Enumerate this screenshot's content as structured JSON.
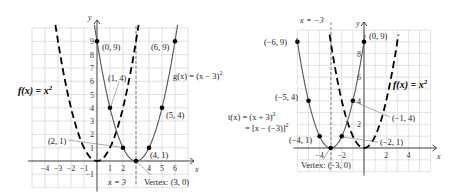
{
  "chart_data": [
    {
      "type": "line",
      "title": "Horizontal shift right: g(x) = (x - 3)^2",
      "xlabel": "x",
      "ylabel": "y",
      "xlim": [
        -5,
        7
      ],
      "ylim": [
        -2,
        10
      ],
      "grid": true,
      "x_ticks": [
        "-4",
        "-3",
        "-2",
        "-1",
        "1",
        "2",
        "4",
        "5",
        "6"
      ],
      "y_ticks": [
        "-1",
        "1",
        "2",
        "3",
        "4",
        "5",
        "6",
        "7",
        "8",
        "9"
      ],
      "series": [
        {
          "name": "f(x) = x^2",
          "style": "dashed",
          "function": "x^2"
        },
        {
          "name": "g(x) = (x - 3)^2",
          "style": "solid",
          "function": "(x-3)^2",
          "points": [
            {
              "x": 0,
              "y": 9,
              "label": "(0, 9)"
            },
            {
              "x": 1,
              "y": 4,
              "label": "(1, 4)"
            },
            {
              "x": 2,
              "y": 1,
              "label": "(2, 1)"
            },
            {
              "x": 3,
              "y": 0,
              "label": "Vertex: (3, 0)"
            },
            {
              "x": 4,
              "y": 1,
              "label": "(4, 1)"
            },
            {
              "x": 5,
              "y": 4,
              "label": "(5, 4)"
            },
            {
              "x": 6,
              "y": 9,
              "label": "(6, 9)"
            }
          ]
        }
      ],
      "annotations": {
        "axis_of_symmetry": "x = 3",
        "vertex": "Vertex: (3, 0)",
        "f_label": "f(x) = x²",
        "g_label": "g(x) = (x − 3)²"
      }
    },
    {
      "type": "line",
      "title": "Horizontal shift left: t(x) = (x + 3)^2",
      "xlabel": "x",
      "ylabel": "y",
      "xlim": [
        -6,
        6
      ],
      "ylim": [
        -2,
        10
      ],
      "grid": true,
      "x_ticks": [
        "-4",
        "-2",
        "2",
        "4"
      ],
      "y_ticks": [
        "2",
        "4",
        "6",
        "8"
      ],
      "series": [
        {
          "name": "f(x) = x^2",
          "style": "dashed",
          "function": "x^2"
        },
        {
          "name": "t(x) = (x + 3)^2",
          "style": "solid",
          "function": "(x+3)^2",
          "points": [
            {
              "x": -6,
              "y": 9,
              "label": "(−6, 9)"
            },
            {
              "x": -5,
              "y": 4,
              "label": "(−5, 4)"
            },
            {
              "x": -4,
              "y": 1,
              "label": "(−4, 1)"
            },
            {
              "x": -3,
              "y": 0,
              "label": "Vertex: (−3, 0)"
            },
            {
              "x": -2,
              "y": 1,
              "label": "(−2, 1)"
            },
            {
              "x": -1,
              "y": 4,
              "label": "(−1, 4)"
            },
            {
              "x": 0,
              "y": 9,
              "label": "(0, 9)"
            }
          ]
        }
      ],
      "annotations": {
        "axis_of_symmetry": "x = −3",
        "vertex": "Vertex: (−3, 0)",
        "f_label": "f(x) = x²",
        "t_label_line1": "t(x) = (x + 3)²",
        "t_label_line2": "= [x − (−3)]²"
      }
    }
  ],
  "left": {
    "axis_x": "x",
    "axis_y": "y",
    "ticks_x": [
      {
        "v": -4,
        "t": "−4"
      },
      {
        "v": -3,
        "t": "−3"
      },
      {
        "v": -2,
        "t": "−2"
      },
      {
        "v": -1,
        "t": "−1"
      },
      {
        "v": 1,
        "t": "1"
      },
      {
        "v": 2,
        "t": "2"
      },
      {
        "v": 4,
        "t": "4"
      },
      {
        "v": 5,
        "t": "5"
      },
      {
        "v": 6,
        "t": "6"
      }
    ],
    "ticks_y": [
      {
        "v": -1,
        "t": "−1"
      },
      {
        "v": 1,
        "t": "1"
      },
      {
        "v": 2,
        "t": "2"
      },
      {
        "v": 3,
        "t": "3"
      },
      {
        "v": 4,
        "t": "4"
      },
      {
        "v": 5,
        "t": "5"
      },
      {
        "v": 6,
        "t": "6"
      },
      {
        "v": 7,
        "t": "7"
      },
      {
        "v": 8,
        "t": "8"
      },
      {
        "v": 9,
        "t": "9"
      }
    ],
    "f_label": "f(x) = x",
    "f_sup": "2",
    "g_label": "g(x) = (x − 3)",
    "g_sup": "2",
    "aos_label": "x = 3",
    "vertex_label": "Vertex: (3, 0)",
    "pt_0_9": "(0, 9)",
    "pt_1_4": "(1, 4)",
    "pt_2_1": "(2, 1)",
    "pt_4_1": "(4, 1)",
    "pt_5_4": "(5, 4)",
    "pt_6_9": "(6, 9)"
  },
  "right": {
    "axis_x": "x",
    "axis_y": "y",
    "ticks_x": [
      {
        "v": -4,
        "t": "−4"
      },
      {
        "v": -2,
        "t": "−2"
      },
      {
        "v": 2,
        "t": "2"
      },
      {
        "v": 4,
        "t": "4"
      }
    ],
    "ticks_y": [
      {
        "v": 2,
        "t": "2"
      },
      {
        "v": 4,
        "t": "4"
      },
      {
        "v": 6,
        "t": "6"
      },
      {
        "v": 8,
        "t": "8"
      }
    ],
    "f_label": "f(x) = x",
    "f_sup": "2",
    "t_label1": "t(x) = (x + 3)",
    "t_sup": "2",
    "t_label2": "= [x − (−3)]",
    "t_sup2": "2",
    "aos_label": "x = −3",
    "vertex_label": "Vertex: (−3, 0)",
    "pt_m6_9": "(−6, 9)",
    "pt_m5_4": "(−5, 4)",
    "pt_m4_1": "(−4, 1)",
    "pt_m2_1": "(−2, 1)",
    "pt_m1_4": "(−1, 4)",
    "pt_0_9": "(0, 9)"
  }
}
